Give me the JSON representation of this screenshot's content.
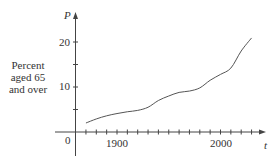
{
  "chart_data": {
    "type": "line",
    "title": "",
    "xlabel": "t",
    "ylabel": "P",
    "ylabel_description": [
      "Percent",
      "aged 65",
      "and over"
    ],
    "origin_label": "0",
    "x_tick_labels": [
      {
        "value": 1900,
        "label": "1900"
      },
      {
        "value": 2000,
        "label": "2000"
      }
    ],
    "y_tick_labels": [
      {
        "value": 10,
        "label": "10"
      },
      {
        "value": 20,
        "label": "20"
      }
    ],
    "x_minor_tick_step": 10,
    "x_ticks_range": [
      1870,
      2030
    ],
    "y_minor_tick_step": 5,
    "y_ticks_range": [
      5,
      20
    ],
    "xlim": [
      1850,
      2040
    ],
    "ylim": [
      -5,
      28
    ],
    "grid": false,
    "legend": null,
    "series": [
      {
        "name": "Percent aged 65 and over",
        "x": [
          1870,
          1880,
          1890,
          1900,
          1910,
          1920,
          1930,
          1940,
          1950,
          1960,
          1970,
          1980,
          1990,
          2000,
          2010,
          2020,
          2030
        ],
        "y": [
          2.0,
          2.9,
          3.6,
          4.1,
          4.5,
          4.8,
          5.5,
          7.0,
          8.0,
          8.8,
          9.1,
          9.8,
          11.5,
          12.8,
          14.2,
          18.0,
          20.9
        ]
      }
    ]
  },
  "labels": {
    "y_var": "P",
    "x_var": "t",
    "origin": "0",
    "x_1900": "1900",
    "x_2000": "2000",
    "y_10": "10",
    "y_20": "20",
    "desc_line1": "Percent",
    "desc_line2": "aged 65",
    "desc_line3": "and over"
  },
  "colors": {
    "axis": "#444444",
    "curve": "#555555",
    "text": "#333333"
  }
}
